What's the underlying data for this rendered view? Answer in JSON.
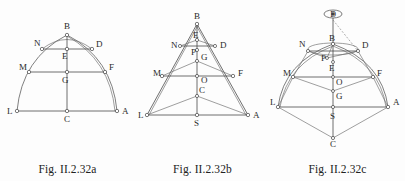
{
  "document": {
    "type": "geometry-figure-plate",
    "background_color": "#fdfdfd",
    "ink_color": "#4a4a4a",
    "panel_count": 3
  },
  "figures": [
    {
      "id": "fig-a",
      "caption": "Fig. II.2.32a",
      "description": "Arched (parabolic) dome profile with horizontal chords",
      "point_labels": [
        "B",
        "N",
        "D",
        "E",
        "M",
        "F",
        "G",
        "L",
        "C",
        "A"
      ],
      "points": {
        "B": {
          "label": "B",
          "x": 67,
          "y": 35
        },
        "N": {
          "label": "N",
          "x": 42,
          "y": 49
        },
        "D": {
          "label": "D",
          "x": 92,
          "y": 49
        },
        "E": {
          "label": "E",
          "x": 67,
          "y": 49
        },
        "M": {
          "label": "M",
          "x": 29,
          "y": 72
        },
        "F": {
          "label": "F",
          "x": 105,
          "y": 72
        },
        "G": {
          "label": "G",
          "x": 67,
          "y": 72
        },
        "L": {
          "label": "L",
          "x": 17,
          "y": 111
        },
        "C": {
          "label": "C",
          "x": 67,
          "y": 111
        },
        "A": {
          "label": "A",
          "x": 117,
          "y": 111
        }
      }
    },
    {
      "id": "fig-b",
      "caption": "Fig. II.2.32b",
      "description": "Conical/pyramidal elevation with apex B and base line L-S-A",
      "point_labels": [
        "B",
        "E",
        "N",
        "D",
        "P",
        "G",
        "M",
        "F",
        "O",
        "C",
        "L",
        "A",
        "S"
      ],
      "points": {
        "B": {
          "label": "B",
          "x": 62,
          "y": 24
        },
        "E": {
          "label": "E",
          "x": 62,
          "y": 40
        },
        "N": {
          "label": "N",
          "x": 45,
          "y": 46
        },
        "D": {
          "label": "D",
          "x": 80,
          "y": 46
        },
        "P": {
          "label": "P",
          "x": 62,
          "y": 50
        },
        "G": {
          "label": "G",
          "x": 62,
          "y": 61
        },
        "M": {
          "label": "M",
          "x": 27,
          "y": 76
        },
        "F": {
          "label": "F",
          "x": 98,
          "y": 76
        },
        "O": {
          "label": "O",
          "x": 62,
          "y": 76
        },
        "C": {
          "label": "C",
          "x": 62,
          "y": 96
        },
        "L": {
          "label": "L",
          "x": 12,
          "y": 115
        },
        "A": {
          "label": "A",
          "x": 113,
          "y": 115
        },
        "S": {
          "label": "S",
          "x": 62,
          "y": 115
        }
      }
    },
    {
      "id": "fig-c",
      "caption": "Fig. II.2.32c",
      "description": "Perspective view of dome with eye point marked above",
      "eye_marker": {
        "label": "D",
        "x": 63,
        "y": 15
      },
      "point_labels": [
        "B",
        "N",
        "D",
        "P",
        "E",
        "M",
        "F",
        "O",
        "G",
        "L",
        "A",
        "S",
        "C"
      ],
      "points": {
        "B": {
          "label": "B",
          "x": 63,
          "y": 44
        },
        "N": {
          "label": "N",
          "x": 38,
          "y": 51
        },
        "D": {
          "label": "D",
          "x": 86,
          "y": 51
        },
        "P": {
          "label": "P",
          "x": 57,
          "y": 58
        },
        "E": {
          "label": "E",
          "x": 63,
          "y": 67
        },
        "M": {
          "label": "M",
          "x": 23,
          "y": 77
        },
        "F": {
          "label": "F",
          "x": 103,
          "y": 77
        },
        "O": {
          "label": "O",
          "x": 63,
          "y": 80
        },
        "G": {
          "label": "G",
          "x": 63,
          "y": 99
        },
        "L": {
          "label": "L",
          "x": 8,
          "y": 107
        },
        "A": {
          "label": "A",
          "x": 118,
          "y": 107
        },
        "S": {
          "label": "S",
          "x": 63,
          "y": 113
        },
        "C": {
          "label": "C",
          "x": 63,
          "y": 138
        }
      }
    }
  ]
}
